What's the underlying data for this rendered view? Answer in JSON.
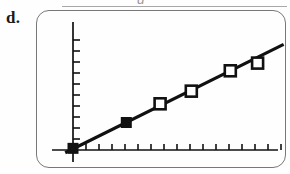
{
  "panel": {
    "label": "d.",
    "scan_artifact_glyph": "g"
  },
  "chart_data": {
    "type": "scatter",
    "title": "",
    "subtitle": "",
    "xlabel": "",
    "ylabel": "",
    "grid": false,
    "legend_position": "none",
    "axis_labels_shown": false,
    "tick_labels_shown": false,
    "x_axis": {
      "start_px": 52,
      "end_px": 278,
      "tick_count": 17,
      "tick_spacing_px": 13,
      "tick_direction": "up",
      "range": [
        0,
        17
      ]
    },
    "y_axis": {
      "origin_px": 73,
      "top_px": 22,
      "bottom_px": 150,
      "tick_count": 10,
      "tick_spacing_px": 11,
      "tick_direction": "right",
      "range": [
        0,
        10
      ]
    },
    "fit_line": {
      "label": "regression line",
      "x1": -0.6,
      "y1": -0.25,
      "x2": 16.2,
      "y2": 9.6,
      "slope": 0.585,
      "intercept": 0.1,
      "width_px": 3.1,
      "color": "#111111"
    },
    "series": [
      {
        "name": "observed",
        "marker": "filled-square",
        "marker_color": "#111111",
        "marker_size_px": 11,
        "points": [
          {
            "x": 0.0,
            "y": 0.15
          },
          {
            "x": 4.1,
            "y": 2.5
          }
        ]
      },
      {
        "name": "predicted",
        "marker": "open-square",
        "marker_color": "#111111",
        "marker_fill": "#ffffff",
        "marker_size_px": 11,
        "points": [
          {
            "x": 6.7,
            "y": 4.2
          },
          {
            "x": 9.1,
            "y": 5.35
          },
          {
            "x": 12.1,
            "y": 7.2
          },
          {
            "x": 14.2,
            "y": 7.9
          }
        ]
      }
    ]
  },
  "colors": {
    "frame": "#787878",
    "ink": "#111111",
    "background": "#fefefe"
  }
}
